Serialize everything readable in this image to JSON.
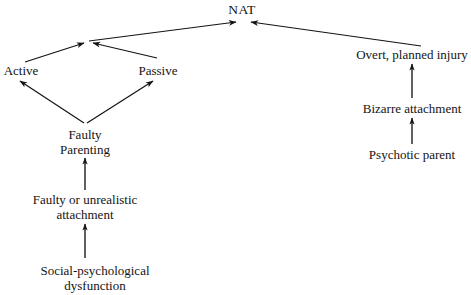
{
  "diagram": {
    "background_color": "#ffffff",
    "stroke_color": "#141414",
    "nodes": {
      "nat": {
        "label": "NAT"
      },
      "active": {
        "label": "Active"
      },
      "passive": {
        "label": "Passive"
      },
      "faulty_parenting": {
        "line1": "Faulty",
        "line2": "Parenting"
      },
      "faulty_attachment": {
        "line1": "Faulty or unrealistic",
        "line2": "attachment"
      },
      "social_dysfunction": {
        "line1": "Social-psychological",
        "line2": "dysfunction"
      },
      "overt_injury": {
        "label": "Overt, planned injury"
      },
      "bizarre_attachment": {
        "label": "Bizarre attachment"
      },
      "psychotic_parent": {
        "label": "Psychotic parent"
      }
    },
    "edges": [
      {
        "from": "junction-left",
        "to": "nat"
      },
      {
        "from": "overt_injury",
        "to": "nat"
      },
      {
        "from": "active",
        "to": "junction-left"
      },
      {
        "from": "passive",
        "to": "junction-left"
      },
      {
        "from": "faulty_parenting",
        "to": "active"
      },
      {
        "from": "faulty_parenting",
        "to": "passive"
      },
      {
        "from": "faulty_attachment",
        "to": "faulty_parenting"
      },
      {
        "from": "social_dysfunction",
        "to": "faulty_attachment"
      },
      {
        "from": "bizarre_attachment",
        "to": "overt_injury"
      },
      {
        "from": "psychotic_parent",
        "to": "bizarre_attachment"
      }
    ]
  }
}
